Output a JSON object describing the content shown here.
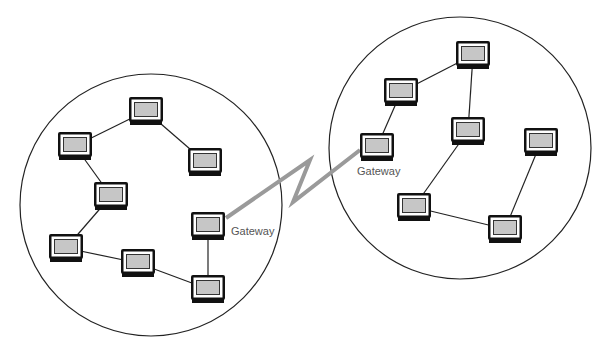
{
  "diagram": {
    "type": "network-topology",
    "colors": {
      "background": "#ffffff",
      "circle_stroke": "#222222",
      "link_stroke": "#222222",
      "wan_link": "#9a9a9a",
      "monitor_frame": "#111111",
      "monitor_bezel": "#ffffff",
      "monitor_screen": "#c6c6c6",
      "label_text": "#555555"
    },
    "networks": [
      {
        "id": "left",
        "circle": {
          "cx": 151,
          "cy": 205,
          "r": 131
        },
        "nodes": [
          {
            "id": "L1",
            "x": 146,
            "y": 111
          },
          {
            "id": "L2",
            "x": 75,
            "y": 146
          },
          {
            "id": "L3",
            "x": 205,
            "y": 162
          },
          {
            "id": "L4",
            "x": 111,
            "y": 196
          },
          {
            "id": "L5",
            "x": 66,
            "y": 248
          },
          {
            "id": "L6",
            "x": 138,
            "y": 263
          },
          {
            "id": "L7",
            "x": 208,
            "y": 226,
            "gateway": true
          },
          {
            "id": "L8",
            "x": 208,
            "y": 289
          }
        ],
        "links": [
          [
            "L1",
            "L2"
          ],
          [
            "L1",
            "L3"
          ],
          [
            "L2",
            "L4"
          ],
          [
            "L4",
            "L5"
          ],
          [
            "L5",
            "L6"
          ],
          [
            "L6",
            "L8"
          ],
          [
            "L7",
            "L8"
          ]
        ]
      },
      {
        "id": "right",
        "circle": {
          "cx": 460,
          "cy": 148,
          "r": 131
        },
        "nodes": [
          {
            "id": "R1",
            "x": 473,
            "y": 55
          },
          {
            "id": "R2",
            "x": 401,
            "y": 92
          },
          {
            "id": "R3",
            "x": 468,
            "y": 131
          },
          {
            "id": "R4",
            "x": 377,
            "y": 147,
            "gateway": true
          },
          {
            "id": "R5",
            "x": 541,
            "y": 142
          },
          {
            "id": "R6",
            "x": 414,
            "y": 207
          },
          {
            "id": "R7",
            "x": 505,
            "y": 229
          }
        ],
        "links": [
          [
            "R1",
            "R2"
          ],
          [
            "R1",
            "R3"
          ],
          [
            "R2",
            "R4"
          ],
          [
            "R3",
            "R6"
          ],
          [
            "R6",
            "R7"
          ],
          [
            "R7",
            "R5"
          ]
        ]
      }
    ],
    "wan_link": {
      "from": "L7",
      "to": "R4",
      "points": [
        [
          226,
          218
        ],
        [
          310,
          160
        ],
        [
          293,
          202
        ],
        [
          360,
          150
        ]
      ]
    },
    "labels": [
      {
        "id": "gateway-left",
        "text": "Gateway",
        "x": 231,
        "y": 225
      },
      {
        "id": "gateway-right",
        "text": "Gateway",
        "x": 357,
        "y": 165
      }
    ]
  }
}
